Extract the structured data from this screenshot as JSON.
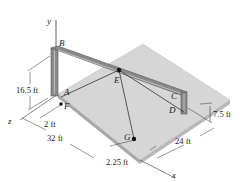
{
  "diagram": {
    "type": "3D statics frame",
    "axes": {
      "x": "x",
      "y": "y",
      "z": "z"
    },
    "points": {
      "A": "A",
      "B": "B",
      "C": "C",
      "D": "D",
      "E": "E",
      "F": "F",
      "G": "G"
    },
    "dimensions": {
      "height_AB": "16.5 ft",
      "offset_F": "2 ft",
      "length_z": "32 ft",
      "offset_G": "2.25 ft",
      "width_x": "24 ft",
      "height_CD": "7.5 ft"
    },
    "colors": {
      "plate_top": "#d6d6d6",
      "plate_edge": "#a8a8a8",
      "frame": "#8a8a8a",
      "frame_dark": "#555555",
      "line": "#333333",
      "text": "#222222"
    }
  }
}
